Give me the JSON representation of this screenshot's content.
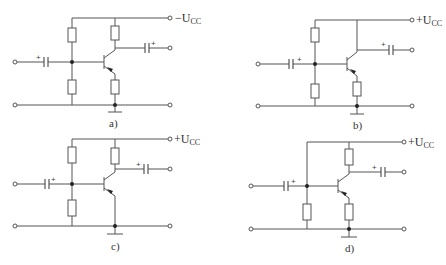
{
  "figure": {
    "panels": [
      {
        "id": "a",
        "label": "a)",
        "supply": "−U",
        "supply_sub": "CC",
        "plus": "+"
      },
      {
        "id": "b",
        "label": "b)",
        "supply": "+U",
        "supply_sub": "CC",
        "plus": "+"
      },
      {
        "id": "c",
        "label": "c)",
        "supply": "+U",
        "supply_sub": "CC",
        "plus": "+"
      },
      {
        "id": "d",
        "label": "d)",
        "supply": "+U",
        "supply_sub": "CC",
        "plus": "+"
      }
    ]
  }
}
